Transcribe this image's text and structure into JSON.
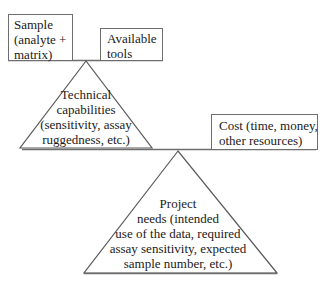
{
  "diagram": {
    "upper_balance": {
      "left_box": {
        "lines": [
          "Sample",
          "(analyte +",
          "matrix)"
        ]
      },
      "right_box": {
        "lines": [
          "Available",
          "tools"
        ]
      },
      "fulcrum": {
        "lines": [
          "Technical",
          "capabilities",
          "(sensitivity, assay",
          "ruggedness, etc.)"
        ]
      }
    },
    "lower_balance": {
      "right_box": {
        "lines": [
          "Cost (time, money,",
          "other resources)"
        ]
      },
      "fulcrum": {
        "lines": [
          "Project",
          "needs (intended",
          "use of the data, required",
          "assay sensitivity, expected",
          "sample number, etc.)"
        ]
      }
    },
    "colors": {
      "line": "#6e6e6e",
      "text": "#1a1a1a",
      "background": "#ffffff"
    }
  }
}
